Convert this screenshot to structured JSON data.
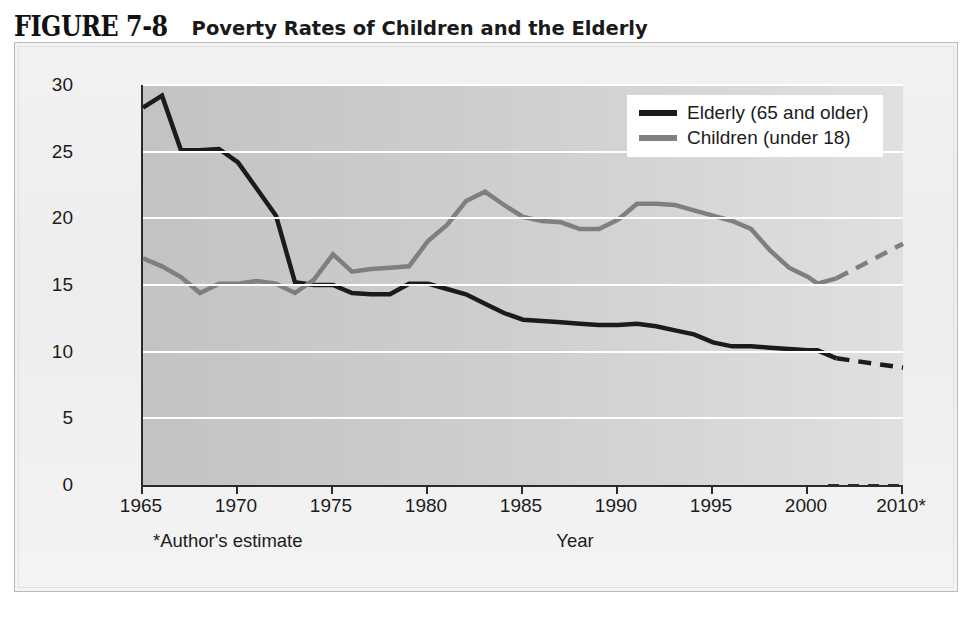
{
  "title": {
    "number": "FIGURE 7-8",
    "caption": "Poverty Rates of Children and the Elderly"
  },
  "colors": {
    "elderly": "#1b1b1b",
    "children": "#7f7f7f",
    "gridline": "#ffffff",
    "axis": "#2b2b2b",
    "plot_bg_left": "#c3c3c3",
    "plot_bg_right": "#e0e0e0",
    "panel_bg": "#f0f0f0"
  },
  "legend": {
    "position": "top-right",
    "entries": [
      {
        "label": "Elderly (65 and older)",
        "color": "#1b1b1b",
        "swatch": "line-swatch-elderly"
      },
      {
        "label": "Children (under 18)",
        "color": "#7f7f7f",
        "swatch": "line-swatch-children"
      }
    ]
  },
  "axes": {
    "y_title": "Percent of age groups",
    "y_ticks": [
      "0",
      "5",
      "10",
      "15",
      "20",
      "25",
      "30"
    ],
    "x_title": "Year",
    "x_ticks": [
      "1965",
      "1970",
      "1975",
      "1980",
      "1985",
      "1990",
      "1995",
      "2000",
      "2010*"
    ],
    "footnote": "*Author's estimate"
  },
  "chart_data": {
    "type": "line",
    "title": "Poverty Rates of Children and the Elderly",
    "xlabel": "Year",
    "ylabel": "Percent of age groups",
    "xlim": [
      1965,
      2010
    ],
    "ylim": [
      0,
      30
    ],
    "ytick_values": [
      0,
      5,
      10,
      15,
      20,
      25,
      30
    ],
    "xtick_values": [
      1965,
      1970,
      1975,
      1980,
      1985,
      1990,
      1995,
      2000,
      2010
    ],
    "grid": "horizontal-white-gridlines",
    "series": [
      {
        "name": "Elderly (65 and older)",
        "color": "#1b1b1b",
        "x": [
          1965,
          1966,
          1967,
          1968,
          1969,
          1970,
          1971,
          1972,
          1973,
          1974,
          1975,
          1976,
          1977,
          1978,
          1979,
          1980,
          1981,
          1982,
          1983,
          1984,
          1985,
          1986,
          1987,
          1988,
          1989,
          1990,
          1991,
          1992,
          1993,
          1994,
          1995,
          1996,
          1997,
          1998,
          1999,
          2000,
          2001,
          2003,
          2010
        ],
        "y": [
          28.3,
          29.2,
          25.1,
          25.1,
          25.2,
          24.2,
          22.2,
          20.2,
          15.2,
          15.0,
          15.0,
          14.4,
          14.3,
          14.3,
          15.1,
          15.1,
          14.7,
          14.3,
          13.6,
          12.9,
          12.4,
          12.3,
          12.2,
          12.1,
          12.0,
          12.0,
          12.1,
          11.9,
          11.6,
          11.3,
          10.7,
          10.4,
          10.4,
          10.3,
          10.2,
          10.1,
          10.1,
          9.5,
          8.8
        ],
        "dashed_from": 2003,
        "marker": "none",
        "linewidth": 4.5
      },
      {
        "name": "Children (under 18)",
        "color": "#7f7f7f",
        "x": [
          1965,
          1966,
          1967,
          1968,
          1969,
          1970,
          1971,
          1972,
          1973,
          1974,
          1975,
          1976,
          1977,
          1978,
          1979,
          1980,
          1981,
          1982,
          1983,
          1984,
          1985,
          1986,
          1987,
          1988,
          1989,
          1990,
          1991,
          1992,
          1993,
          1994,
          1995,
          1996,
          1997,
          1998,
          1999,
          2000,
          2001,
          2003,
          2010
        ],
        "y": [
          17.0,
          16.4,
          15.6,
          14.4,
          15.1,
          15.1,
          15.3,
          15.1,
          14.4,
          15.4,
          17.3,
          16.0,
          16.2,
          16.3,
          16.4,
          18.3,
          19.5,
          21.3,
          22.0,
          21.0,
          20.1,
          19.8,
          19.7,
          19.2,
          19.2,
          19.9,
          21.1,
          21.1,
          21.0,
          20.6,
          20.2,
          19.8,
          19.2,
          17.6,
          16.3,
          15.6,
          15.1,
          15.5,
          18.1
        ],
        "dashed_from": 2003,
        "marker": "none",
        "linewidth": 4.5
      }
    ]
  }
}
